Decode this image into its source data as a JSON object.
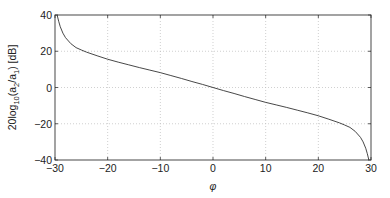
{
  "chart_data": {
    "type": "line",
    "title": "",
    "xlabel": "φ",
    "ylabel": "20log10(a2/a1) [dB]",
    "ylabel_parts": {
      "pre": "20log",
      "sub1": "10",
      "mid": "(a",
      "sub2": "2",
      "slash": "/a",
      "sub3": "1",
      "post": ") [dB]"
    },
    "xlim": [
      -30,
      30
    ],
    "ylim": [
      -40,
      40
    ],
    "xticks": [
      -30,
      -20,
      -10,
      0,
      10,
      20,
      30
    ],
    "yticks": [
      -40,
      -20,
      0,
      20,
      40
    ],
    "xtick_labels": [
      "−30",
      "−20",
      "−10",
      "0",
      "10",
      "20",
      "30"
    ],
    "ytick_labels": [
      "−40",
      "−20",
      "0",
      "20",
      "40"
    ],
    "grid": true,
    "legend": null,
    "series": [
      {
        "name": "20log10(a2/a1)",
        "color": "#333333",
        "x": [
          -29.6,
          -29.3,
          -29.0,
          -28.5,
          -28.0,
          -27.0,
          -26.0,
          -25.0,
          -24.0,
          -22.0,
          -20.0,
          -18.0,
          -16.0,
          -14.0,
          -12.0,
          -10.0,
          -8.0,
          -6.0,
          -4.0,
          -2.0,
          0.0,
          2.0,
          4.0,
          6.0,
          8.0,
          10.0,
          12.0,
          14.0,
          16.0,
          18.0,
          20.0,
          22.0,
          24.0,
          25.0,
          26.0,
          27.0,
          28.0,
          28.5,
          29.0,
          29.3,
          29.6
        ],
        "y": [
          40.0,
          36.5,
          33.5,
          30.0,
          27.5,
          24.2,
          22.0,
          20.7,
          19.5,
          17.5,
          15.6,
          14.0,
          12.5,
          11.0,
          9.6,
          8.2,
          6.6,
          5.0,
          3.3,
          1.7,
          0.0,
          -1.7,
          -3.3,
          -5.0,
          -6.6,
          -8.2,
          -9.6,
          -11.0,
          -12.5,
          -14.0,
          -15.6,
          -17.5,
          -19.5,
          -20.7,
          -22.0,
          -24.2,
          -27.5,
          -30.0,
          -33.5,
          -36.5,
          -40.0
        ]
      }
    ]
  }
}
